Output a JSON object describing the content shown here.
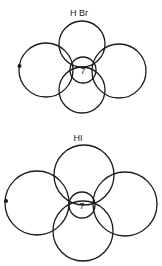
{
  "diagrams": [
    {
      "label": "H Br",
      "center_number": "7",
      "description": "Overlapping orbital circles around central atom with 7 valence electrons"
    },
    {
      "label": "HI",
      "center_number": "7",
      "description": "Overlapping orbital circles around central atom with 7 valence electrons"
    }
  ],
  "colors": {
    "stroke": "#1a1a1a",
    "background": "#ffffff"
  }
}
